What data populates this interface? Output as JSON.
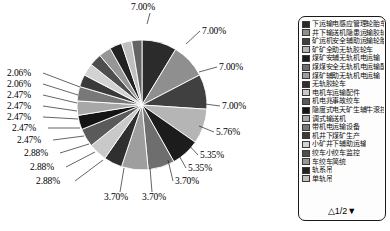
{
  "chart_data": {
    "type": "pie",
    "title": "",
    "subtitle": "",
    "xlabel": "",
    "ylabel": "",
    "legend_position": "right",
    "grid": false,
    "value_unit": "percent",
    "labels_shown_on_chart": [
      "7.00%",
      "7.00%",
      "7.00%",
      "7.00%",
      "5.76%",
      "5.35%",
      "5.35%",
      "3.70%",
      "3.70%",
      "3.70%",
      "2.88%",
      "2.88%",
      "2.88%",
      "2.47%",
      "2.47%",
      "2.47%",
      "2.47%",
      "2.47%",
      "2.06%",
      "2.06%"
    ],
    "categories": [
      "下运输电感应管理轮胎车",
      "井下输送机隐患运输管胶轮车",
      "矿运机安全辅助运输轮胎车",
      "矿井全助无轨胶轮车",
      "煤矿安辅无轨机电运输",
      "煤矿安全无轨机电运输配件",
      "煤矿辅助无轨机电运输",
      "无轨胶轮车",
      "电机车",
      "机电运输配件",
      "机电运输事故调度",
      "隐患排查调度绞车",
      "调度绞车运输",
      "带式输送机",
      "机电运输设备",
      "刮板输送机设备",
      "井下无轨胶轮车产",
      "矿井下辅助运输",
      "小绞车监控系统",
      "绞车吊挂单轨吊"
    ],
    "values": [
      7.0,
      7.0,
      7.0,
      7.0,
      5.76,
      5.35,
      5.35,
      3.7,
      3.7,
      3.7,
      2.88,
      2.88,
      2.88,
      2.47,
      2.47,
      2.47,
      2.47,
      2.47,
      2.06,
      2.06
    ],
    "colors": [
      "#2b2b2b",
      "#8f8f8f",
      "#404040",
      "#b5b5b5",
      "#1c1c1c",
      "#6e6e6e",
      "#9e9e9e",
      "#2f2f2f",
      "#c9c9c9",
      "#5a5a5a",
      "#141414",
      "#a8a8a8",
      "#787878",
      "#3a3a3a",
      "#d2d2d2",
      "#4e4e4e",
      "#969696",
      "#222222",
      "#bfbfbf",
      "#646464"
    ],
    "slice_separator_color": "#ffffff"
  },
  "pie_labels": [
    {
      "text": "7.00%",
      "side": "top"
    },
    {
      "text": "7.00%",
      "side": "right"
    },
    {
      "text": "7.00%",
      "side": "right"
    },
    {
      "text": "7.00%",
      "side": "right"
    },
    {
      "text": "5.76%",
      "side": "right"
    },
    {
      "text": "5.35%",
      "side": "right"
    },
    {
      "text": "5.35%",
      "side": "right"
    },
    {
      "text": "3.70%",
      "side": "right"
    },
    {
      "text": "3.70%",
      "side": "bottom"
    },
    {
      "text": "3.70%",
      "side": "bottom"
    },
    {
      "text": "2.88%",
      "side": "left"
    },
    {
      "text": "2.88%",
      "side": "left"
    },
    {
      "text": "2.88%",
      "side": "left"
    },
    {
      "text": "2.47%",
      "side": "left"
    },
    {
      "text": "2.47%",
      "side": "left"
    },
    {
      "text": "2.47%",
      "side": "left"
    },
    {
      "text": "2.47%",
      "side": "left"
    },
    {
      "text": "2.47%",
      "side": "left"
    },
    {
      "text": "2.06%",
      "side": "left"
    },
    {
      "text": "2.06%",
      "side": "left"
    }
  ],
  "legend": {
    "items": [
      {
        "label": "下运输电感应管理轮胎车",
        "color": "#2b2b2b"
      },
      {
        "label": "井下输送机隐患运输胶轮车",
        "color": "#8f8f8f"
      },
      {
        "label": "矿运机安全辅助运输轮胎车",
        "color": "#404040"
      },
      {
        "label": "矿矿全助无轨胶轮车",
        "color": "#b5b5b5"
      },
      {
        "label": "煤矿安辅无轨机电运输",
        "color": "#1c1c1c"
      },
      {
        "label": "煤煤安全无轨机电运输配件",
        "color": "#6e6e6e"
      },
      {
        "label": "煤矿辅助无轨机电运输",
        "color": "#9e9e9e"
      },
      {
        "label": "无轨胶轮车",
        "color": "#2f2f2f"
      },
      {
        "label": "电机车运输配件",
        "color": "#c9c9c9"
      },
      {
        "label": "机电兆事故绞车",
        "color": "#5a5a5a"
      },
      {
        "label": "隐度式电天矿生辅牛滚控轨",
        "color": "#141414"
      },
      {
        "label": "调式输送机",
        "color": "#a8a8a8"
      },
      {
        "label": "带机电运输设备",
        "color": "#787878"
      },
      {
        "label": "机井下煤矿生产",
        "color": "#3a3a3a"
      },
      {
        "label": "小矿井下辅助运输",
        "color": "#d2d2d2"
      },
      {
        "label": "绞车小绞车监控",
        "color": "#4e4e4e"
      },
      {
        "label": "车绞车简统",
        "color": "#969696"
      },
      {
        "label": "轨系吊",
        "color": "#222222"
      },
      {
        "label": "单轨吊",
        "color": "#bfbfbf"
      }
    ],
    "pager": "△1/2▼",
    "pager_prev_icon": "triangle-up-icon",
    "pager_next_icon": "triangle-down-icon"
  }
}
